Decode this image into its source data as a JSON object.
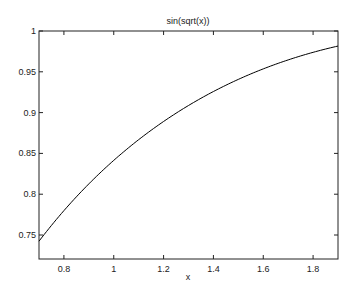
{
  "chart_data": {
    "type": "line",
    "title": "sin(sqrt(x))",
    "xlabel": "x",
    "ylabel": "",
    "xlim": [
      0.7,
      1.9
    ],
    "ylim": [
      0.7206,
      1.0
    ],
    "xticks": [
      0.8,
      1.0,
      1.2,
      1.4,
      1.6,
      1.8
    ],
    "xtick_labels": [
      "0.8",
      "1",
      "1.2",
      "1.4",
      "1.6",
      "1.8"
    ],
    "yticks": [
      0.75,
      0.8,
      0.85,
      0.9,
      0.95,
      1.0
    ],
    "ytick_labels": [
      "0.75",
      "0.8",
      "0.85",
      "0.9",
      "0.95",
      "1"
    ],
    "grid": false,
    "legend": null,
    "series": [
      {
        "name": "sin(sqrt(x))",
        "function": "sin(sqrt(x))",
        "x": [
          0.7,
          0.8,
          0.9,
          1.0,
          1.1,
          1.2,
          1.3,
          1.4,
          1.5,
          1.6,
          1.7,
          1.8,
          1.9
        ],
        "y": [
          0.7426,
          0.7777,
          0.8086,
          0.8415,
          0.8677,
          0.8907,
          0.9109,
          0.9286,
          0.9441,
          0.9576,
          0.9692,
          0.979,
          0.9873
        ],
        "color": "#000000"
      }
    ]
  },
  "plot_area": {
    "left": 39,
    "top": 31,
    "right": 338,
    "bottom": 259
  }
}
